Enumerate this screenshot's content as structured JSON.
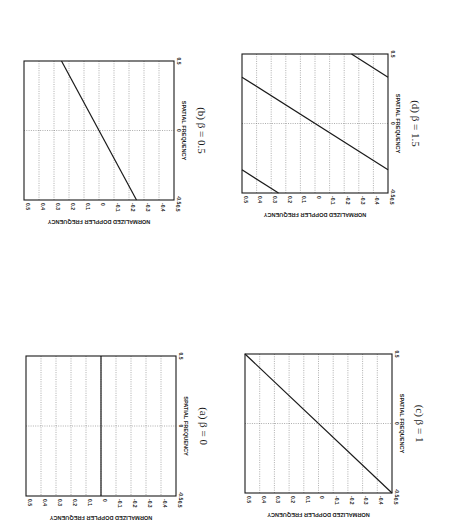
{
  "page": {
    "orientation": "rotated 90 degrees clockwise (landscape figure on portrait page)",
    "background": "#ffffff",
    "ink": "#1a1a1a"
  },
  "chart_data": [
    {
      "id": "a",
      "type": "line",
      "title": "(a) β = 0",
      "beta": 0,
      "xlabel": "SPATIAL FREQUENCY",
      "ylabel": "NORMALIZED DOPPLER FREQUENCY",
      "xlim": [
        -0.5,
        0.5
      ],
      "ylim": [
        -0.5,
        0.5
      ],
      "xticks": [
        "-0.5",
        "0",
        "0.5"
      ],
      "yticks": [
        "0.5",
        "0.4",
        "0.3",
        "0.2",
        "0.1",
        "0",
        "-0.1",
        "-0.2",
        "-0.3",
        "-0.4",
        "-0.5"
      ],
      "grid": true,
      "segments": [
        {
          "x": [
            -0.5,
            0.5
          ],
          "y": [
            0,
            0
          ]
        }
      ],
      "box": {
        "left": 26,
        "top": 356,
        "right": 176,
        "bottom": 496
      }
    },
    {
      "id": "b",
      "type": "line",
      "title": "(b) β = 0.5",
      "beta": 0.5,
      "xlabel": "SPATIAL FREQUENCY",
      "ylabel": "NORMALIZED DOPPLER FREQUENCY",
      "xlim": [
        -0.5,
        0.5
      ],
      "ylim": [
        -0.5,
        0.5
      ],
      "xticks": [
        "-0.5",
        "0",
        "0.5"
      ],
      "yticks": [
        "0.5",
        "0.4",
        "0.3",
        "0.2",
        "0.1",
        "0",
        "-0.1",
        "-0.2",
        "-0.3",
        "-0.4",
        "-0.5"
      ],
      "grid": true,
      "segments": [
        {
          "x": [
            -0.5,
            0.5
          ],
          "y": [
            -0.25,
            0.25
          ]
        }
      ],
      "box": {
        "left": 24,
        "top": 61,
        "right": 174,
        "bottom": 200
      }
    },
    {
      "id": "c",
      "type": "line",
      "title": "(c) β = 1",
      "beta": 1,
      "xlabel": "SPATIAL FREQUENCY",
      "ylabel": "NORMALIZED DOPPLER FREQUENCY",
      "xlim": [
        -0.5,
        0.5
      ],
      "ylim": [
        -0.5,
        0.5
      ],
      "xticks": [
        "-0.5",
        "0",
        "0.5"
      ],
      "yticks": [
        "0.5",
        "0.4",
        "0.3",
        "0.2",
        "0.1",
        "0",
        "-0.1",
        "-0.2",
        "-0.3",
        "-0.4",
        "-0.5"
      ],
      "grid": true,
      "segments": [
        {
          "x": [
            -0.5,
            0.5
          ],
          "y": [
            -0.5,
            0.5
          ]
        }
      ],
      "box": {
        "left": 245,
        "top": 354,
        "right": 392,
        "bottom": 493
      }
    },
    {
      "id": "d",
      "type": "line",
      "title": "(d) β = 1.5",
      "beta": 1.5,
      "xlabel": "SPATIAL FREQUENCY",
      "ylabel": "NORMALIZED DOPPLER FREQUENCY",
      "xlim": [
        -0.5,
        0.5
      ],
      "ylim": [
        -0.5,
        0.5
      ],
      "xticks": [
        "-0.5",
        "0",
        "0.5"
      ],
      "yticks": [
        "0.5",
        "0.4",
        "0.3",
        "0.2",
        "0.1",
        "0",
        "-0.1",
        "-0.2",
        "-0.3",
        "-0.4",
        "-0.5"
      ],
      "grid": true,
      "segments": [
        {
          "x": [
            -0.3333,
            0.3333
          ],
          "y": [
            -0.5,
            0.5
          ]
        },
        {
          "x": [
            -0.5,
            -0.3333
          ],
          "y": [
            0.25,
            0.5
          ]
        },
        {
          "x": [
            0.3333,
            0.5
          ],
          "y": [
            -0.5,
            -0.25
          ]
        }
      ],
      "box": {
        "left": 242,
        "top": 54,
        "right": 388,
        "bottom": 193
      }
    }
  ]
}
